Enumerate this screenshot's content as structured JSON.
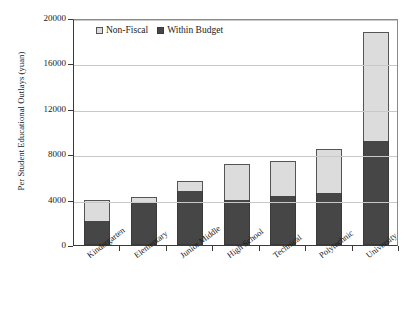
{
  "chart_data": {
    "type": "bar",
    "subtype": "stacked-vertical",
    "title": "",
    "xlabel": "",
    "ylabel": "Per Student Educational Outlays (yuan)",
    "ylim": [
      0,
      20000
    ],
    "ytick_values": [
      0,
      4000,
      8000,
      12000,
      16000,
      20000
    ],
    "ytick_labels": [
      "0",
      "4000",
      "8000",
      "12000",
      "16000",
      "20000"
    ],
    "grid": "horizontal",
    "legend_position": "top-left-inside",
    "categories": [
      "Kindergarten",
      "Elementary",
      "Junior Middle",
      "High School",
      "Technical",
      "Polytechnic",
      "University"
    ],
    "series": [
      {
        "name": "Within Budget",
        "color": "#464646",
        "values": [
          2100,
          3800,
          4800,
          4000,
          4300,
          4600,
          9200
        ]
      },
      {
        "name": "Non-Fiscal",
        "color": "#dcdcdc",
        "values": [
          1900,
          400,
          800,
          3100,
          3100,
          3900,
          9600
        ]
      }
    ],
    "totals": [
      4000,
      4200,
      5600,
      7100,
      7400,
      8500,
      18800
    ]
  },
  "legend": {
    "items": [
      {
        "label": "Non-Fiscal",
        "swatch": "light-gray-square"
      },
      {
        "label": "Within Budget",
        "swatch": "dark-gray-square"
      }
    ]
  },
  "caption": {
    "text": ""
  }
}
